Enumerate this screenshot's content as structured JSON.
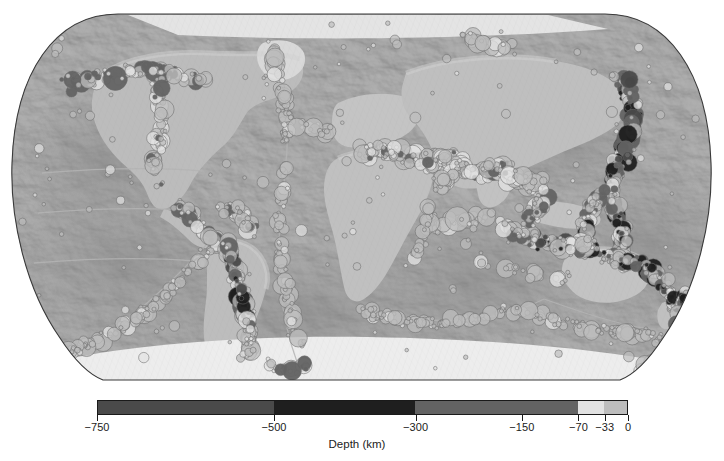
{
  "figure": {
    "title": "Global seismicity map",
    "background_color": "#ffffff",
    "projection": "Robinson",
    "map_frame_color": "#3a3a3a"
  },
  "basemap": {
    "name": "shaded-relief-grayscale",
    "ocean_gray": "#9a9a9a",
    "land_gray": "#b8b8b8",
    "shelf_gray": "#cfcfcf",
    "deep_gray": "#8a8a8a",
    "ice_gray": "#ededed",
    "ridge_gray": "#a8a8a8"
  },
  "colorbar": {
    "label": "Depth (km)",
    "units": "km",
    "orientation": "horizontal",
    "outline_color": "#1a1a1a",
    "range": [
      -750,
      0
    ],
    "tick_values": [
      -750,
      -500,
      -300,
      -150,
      -70,
      -33,
      0
    ],
    "tick_labels": [
      "−750",
      "−500",
      "−300",
      "−150",
      "−70",
      "−33",
      "0"
    ],
    "segments": [
      {
        "from": -750,
        "to": -500,
        "color": "#4a4a4a",
        "name": "deep-focus"
      },
      {
        "from": -500,
        "to": -300,
        "color": "#1f1f1f",
        "name": "very-deep-focus"
      },
      {
        "from": -300,
        "to": -70,
        "color": "#636363",
        "name": "intermediate-focus"
      },
      {
        "from": -70,
        "to": -33,
        "color": "#e2e2e2",
        "name": "shallow-focus"
      },
      {
        "from": -33,
        "to": 0,
        "color": "#bdbdbd",
        "name": "crustal"
      }
    ]
  },
  "chart_data": {
    "type": "scatter",
    "title": "",
    "subtitle": "",
    "xlabel": "",
    "ylabel": "",
    "colorbar_label": "Depth (km)",
    "color_range": [
      -750,
      0
    ],
    "grid": false,
    "legend_position": "bottom",
    "marker": "circle",
    "marker_size_encodes": "magnitude",
    "note": "Earthquake epicenters plotted on a grayscale shaded-relief world map in Robinson projection; marker fill encodes hypocentral depth per the Depth (km) colorbar; marker radius encodes magnitude.",
    "color_scale_breaks": [
      -750,
      -500,
      -300,
      -150,
      -70,
      -33,
      0
    ],
    "color_scale_colors": [
      "#4a4a4a",
      "#1f1f1f",
      "#636363",
      "#636363",
      "#e2e2e2",
      "#bdbdbd"
    ],
    "seismic_belts": [
      {
        "name": "Aleutian Arc",
        "depth_class": "intermediate-to-deep",
        "density": "high"
      },
      {
        "name": "Kuril-Kamchatka Trench",
        "depth_class": "deep",
        "density": "very-high"
      },
      {
        "name": "Japan Trench",
        "depth_class": "deep",
        "density": "very-high"
      },
      {
        "name": "Izu-Bonin-Mariana Arc",
        "depth_class": "deep",
        "density": "high"
      },
      {
        "name": "Philippine / Sunda Arc",
        "depth_class": "deep",
        "density": "very-high"
      },
      {
        "name": "Tonga-Kermadec Trench",
        "depth_class": "deep",
        "density": "very-high"
      },
      {
        "name": "New Hebrides / Solomon",
        "depth_class": "intermediate-to-deep",
        "density": "very-high"
      },
      {
        "name": "Andes / Peru-Chile Trench",
        "depth_class": "intermediate-to-deep",
        "density": "very-high"
      },
      {
        "name": "Middle America Trench",
        "depth_class": "intermediate",
        "density": "high"
      },
      {
        "name": "Caribbean Arc",
        "depth_class": "intermediate",
        "density": "moderate"
      },
      {
        "name": "Scotia Arc",
        "depth_class": "intermediate",
        "density": "moderate"
      },
      {
        "name": "Mediterranean-Alpine Belt",
        "depth_class": "shallow-to-intermediate",
        "density": "high"
      },
      {
        "name": "Zagros / Himalaya Belt",
        "depth_class": "shallow-to-intermediate",
        "density": "high"
      },
      {
        "name": "Mid-Atlantic Ridge",
        "depth_class": "shallow",
        "density": "moderate"
      },
      {
        "name": "East Pacific Rise",
        "depth_class": "shallow",
        "density": "moderate"
      },
      {
        "name": "Southwest Indian Ridge",
        "depth_class": "shallow",
        "density": "moderate"
      },
      {
        "name": "Southeast Indian Ridge",
        "depth_class": "shallow",
        "density": "moderate"
      },
      {
        "name": "East African Rift",
        "depth_class": "shallow",
        "density": "low"
      },
      {
        "name": "Pacific-Antarctic Ridge",
        "depth_class": "shallow",
        "density": "moderate"
      }
    ]
  }
}
